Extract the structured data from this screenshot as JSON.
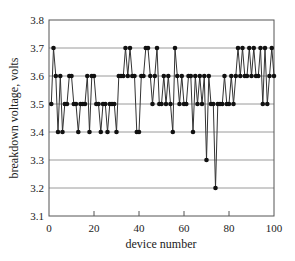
{
  "chart_data": {
    "type": "line",
    "title": "",
    "xlabel": "device number",
    "ylabel": "breakdown voltage, volts",
    "xlim": [
      0,
      100
    ],
    "ylim": [
      3.1,
      3.8
    ],
    "xticks": [
      0,
      20,
      40,
      60,
      80,
      100
    ],
    "xtick_labels": [
      "0",
      "20",
      "40",
      "60",
      "80",
      "100"
    ],
    "yticks": [
      3.1,
      3.2,
      3.3,
      3.4,
      3.5,
      3.6,
      3.7,
      3.8
    ],
    "ytick_labels": [
      "3.1",
      "3.2",
      "3.3",
      "3.4",
      "3.5",
      "3.6",
      "3.7",
      "3.8"
    ],
    "grid": {
      "horizontal": true,
      "vertical": false
    },
    "legend": null,
    "marker": "filled-circle",
    "series": [
      {
        "name": "breakdown voltage",
        "x": [
          1,
          2,
          3,
          4,
          5,
          6,
          7,
          8,
          9,
          10,
          11,
          12,
          13,
          14,
          15,
          16,
          17,
          18,
          19,
          20,
          21,
          22,
          23,
          24,
          25,
          26,
          27,
          28,
          29,
          30,
          31,
          32,
          33,
          34,
          35,
          36,
          37,
          38,
          39,
          40,
          41,
          42,
          43,
          44,
          45,
          46,
          47,
          48,
          49,
          50,
          51,
          52,
          53,
          54,
          55,
          56,
          57,
          58,
          59,
          60,
          61,
          62,
          63,
          64,
          65,
          66,
          67,
          68,
          69,
          70,
          71,
          72,
          73,
          74,
          75,
          76,
          77,
          78,
          79,
          80,
          81,
          82,
          83,
          84,
          85,
          86,
          87,
          88,
          89,
          90,
          91,
          92,
          93,
          94,
          95,
          96,
          97,
          98,
          99,
          100
        ],
        "values": [
          3.5,
          3.7,
          3.6,
          3.4,
          3.6,
          3.4,
          3.5,
          3.5,
          3.6,
          3.6,
          3.5,
          3.5,
          3.4,
          3.5,
          3.5,
          3.5,
          3.6,
          3.4,
          3.6,
          3.6,
          3.5,
          3.5,
          3.4,
          3.5,
          3.5,
          3.4,
          3.5,
          3.5,
          3.5,
          3.4,
          3.6,
          3.6,
          3.6,
          3.7,
          3.6,
          3.7,
          3.6,
          3.6,
          3.4,
          3.4,
          3.6,
          3.6,
          3.7,
          3.7,
          3.6,
          3.5,
          3.6,
          3.7,
          3.5,
          3.5,
          3.6,
          3.5,
          3.6,
          3.5,
          3.4,
          3.7,
          3.6,
          3.5,
          3.6,
          3.5,
          3.5,
          3.6,
          3.6,
          3.4,
          3.6,
          3.5,
          3.6,
          3.5,
          3.6,
          3.3,
          3.6,
          3.5,
          3.5,
          3.2,
          3.5,
          3.5,
          3.5,
          3.6,
          3.5,
          3.5,
          3.6,
          3.5,
          3.6,
          3.7,
          3.6,
          3.7,
          3.6,
          3.6,
          3.7,
          3.6,
          3.7,
          3.6,
          3.6,
          3.7,
          3.5,
          3.7,
          3.5,
          3.6,
          3.7,
          3.6
        ]
      }
    ]
  }
}
